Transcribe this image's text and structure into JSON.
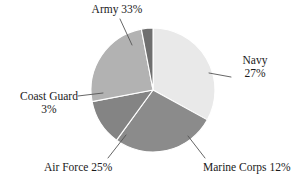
{
  "chart_data": {
    "type": "pie",
    "title": "",
    "subtitle": "",
    "xlabel": "",
    "ylabel": "",
    "legend_position": "none",
    "grid": false,
    "labels_outside": true,
    "categories": [
      "Army",
      "Navy",
      "Marine Corps",
      "Air Force",
      "Coast Guard"
    ],
    "values": [
      33,
      27,
      12,
      25,
      3
    ],
    "unit": "%",
    "start_angle_deg": 0,
    "direction": "clockwise",
    "slice_colors": [
      "#e9e9e9",
      "#8b8b8b",
      "#848484",
      "#b2b2b2",
      "#6f6f6f"
    ],
    "slices": [
      {
        "name": "Army",
        "value": 33,
        "value_text": "33%",
        "color": "#e9e9e9"
      },
      {
        "name": "Navy",
        "value": 27,
        "value_text": "27%",
        "color": "#8b8b8b"
      },
      {
        "name": "Marine Corps",
        "value": 12,
        "value_text": "12%",
        "color": "#848484"
      },
      {
        "name": "Air Force",
        "value": 25,
        "value_text": "25%",
        "color": "#b2b2b2"
      },
      {
        "name": "Coast Guard",
        "value": 3,
        "value_text": "3%",
        "color": "#6f6f6f"
      }
    ]
  },
  "labels": {
    "army": {
      "line1": "Army 33%"
    },
    "navy": {
      "line1": "Navy",
      "line2": "27%"
    },
    "marine_corps": {
      "line1": "Marine Corps 12%"
    },
    "air_force": {
      "line1": "Air Force 25%"
    },
    "coast_guard": {
      "line1": "Coast Guard",
      "line2": "3%"
    }
  },
  "style": {
    "background": "#ffffff",
    "text_color": "#1a1a1a",
    "leader_line_color": "#555555",
    "slice_separator_color": "#ffffff"
  }
}
